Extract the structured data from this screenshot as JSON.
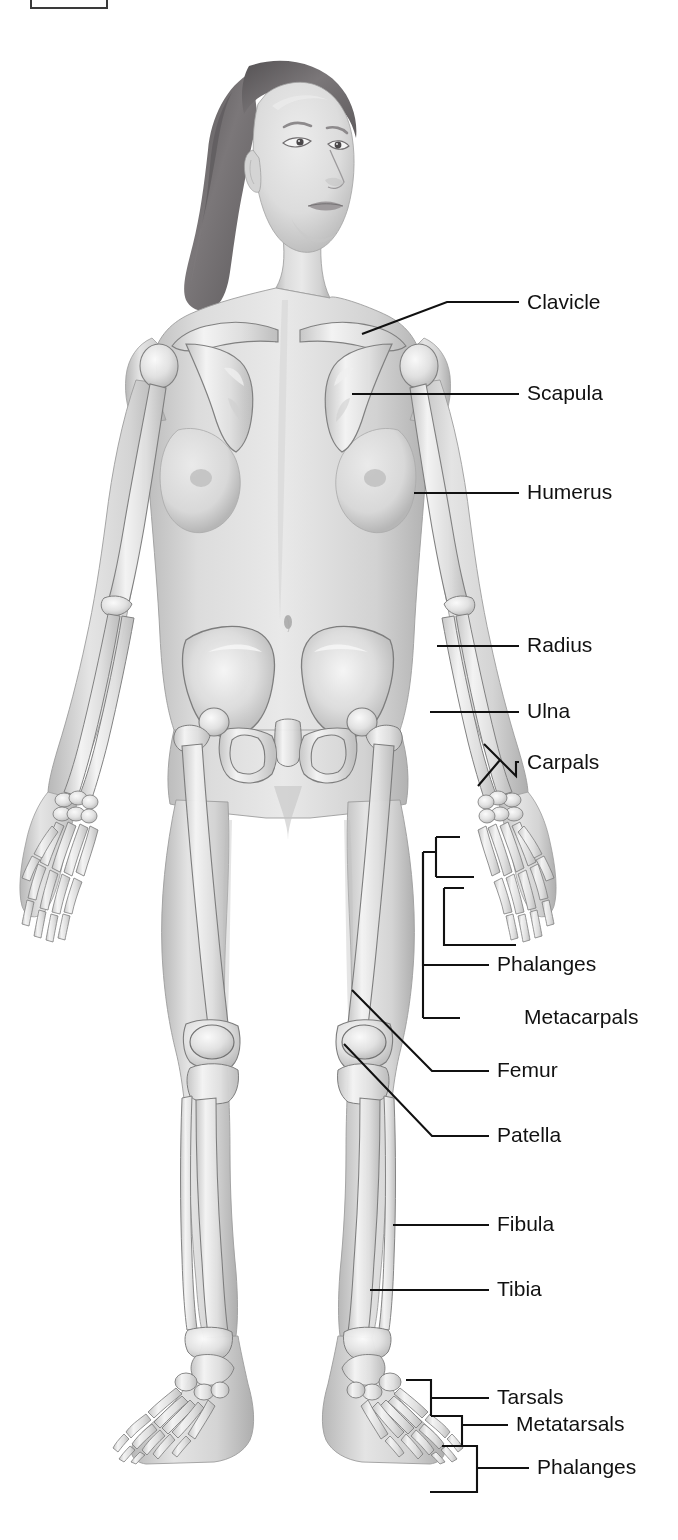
{
  "figure": {
    "view": "anterior",
    "style": "grayscale medical illustration",
    "background_color": "#ffffff",
    "line_color": "#111111",
    "skin_tone_light": "#e2e2e2",
    "skin_tone_mid": "#c9c9c9",
    "skin_tone_shadow": "#a8a8a8",
    "bone_light": "#f2f2f2",
    "bone_mid": "#d6d6d6",
    "bone_outline": "#8a8a8a",
    "hair_color": "#6d6a6c",
    "hair_highlight": "#8f8c8e"
  },
  "crop_marker": {
    "name": "partial-box-top-left",
    "visible": true
  },
  "labels": [
    {
      "id": "clavicle",
      "text": "Clavicle",
      "x": 527,
      "y": 303,
      "leader": "angled"
    },
    {
      "id": "scapula",
      "text": "Scapula",
      "x": 527,
      "y": 394,
      "leader": "straight"
    },
    {
      "id": "humerus",
      "text": "Humerus",
      "x": 527,
      "y": 493,
      "leader": "straight"
    },
    {
      "id": "radius",
      "text": "Radius",
      "x": 527,
      "y": 646,
      "leader": "straight"
    },
    {
      "id": "ulna",
      "text": "Ulna",
      "x": 527,
      "y": 712,
      "leader": "straight"
    },
    {
      "id": "carpals",
      "text": "Carpals",
      "x": 527,
      "y": 763,
      "leader": "diamond-bracket"
    },
    {
      "id": "phalanges-hand",
      "text": "Phalanges",
      "x": 497,
      "y": 965,
      "leader": "nested-bracket"
    },
    {
      "id": "metacarpals",
      "text": "Metacarpals",
      "x": 468,
      "y": 1018,
      "leader": "nested-bracket"
    },
    {
      "id": "femur",
      "text": "Femur",
      "x": 497,
      "y": 1071,
      "leader": "angled"
    },
    {
      "id": "patella",
      "text": "Patella",
      "x": 497,
      "y": 1136,
      "leader": "angled"
    },
    {
      "id": "fibula",
      "text": "Fibula",
      "x": 497,
      "y": 1225,
      "leader": "straight"
    },
    {
      "id": "tibia",
      "text": "Tibia",
      "x": 497,
      "y": 1290,
      "leader": "straight"
    },
    {
      "id": "tarsals",
      "text": "Tarsals",
      "x": 497,
      "y": 1398,
      "leader": "bracket"
    },
    {
      "id": "metatarsals",
      "text": "Metatarsals",
      "x": 468,
      "y": 1425,
      "leader": "bracket"
    },
    {
      "id": "phalanges-foot",
      "text": "Phalanges",
      "x": 537,
      "y": 1468,
      "leader": "bracket"
    }
  ],
  "bone_groups": {
    "upper_limb": [
      "Clavicle",
      "Scapula",
      "Humerus",
      "Radius",
      "Ulna",
      "Carpals",
      "Metacarpals",
      "Phalanges"
    ],
    "lower_limb": [
      "Femur",
      "Patella",
      "Tibia",
      "Fibula",
      "Tarsals",
      "Metatarsals",
      "Phalanges"
    ]
  }
}
